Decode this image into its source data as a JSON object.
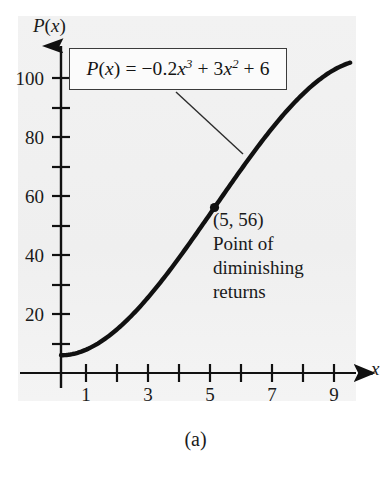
{
  "figure": {
    "caption": "(a)",
    "background_color": "#f1f1f1",
    "ink_color": "#111111"
  },
  "formula": {
    "lhs": "P(x)",
    "eq": "=",
    "text": "P(x) = –0.2x³ + 3x² + 6",
    "coef_cubic": "–0.2",
    "exp_cubic": "3",
    "coef_quadratic": "3",
    "exp_quadratic": "2",
    "constant": "6",
    "boxed": true
  },
  "annotations": {
    "point_label": "(5, 56)",
    "line2": "Point of",
    "line3": "diminishing",
    "line4": "returns"
  },
  "axes": {
    "y_axis_label": "P(x)",
    "x_axis_label": "x",
    "y_ticks_labeled": [
      20,
      40,
      60,
      80,
      100
    ],
    "y_ticks_minor": [
      10,
      30,
      50,
      70,
      90
    ],
    "x_ticks_labeled": [
      1,
      3,
      5,
      7,
      9
    ],
    "x_ticks_minor": [
      2,
      4,
      6,
      8,
      10
    ],
    "x_range": [
      -0.45,
      10.3
    ],
    "y_range": [
      -5,
      112
    ]
  },
  "chart_data": {
    "type": "line",
    "title": "",
    "subtitle": "",
    "xlabel": "x",
    "ylabel": "P(x)",
    "xlim": [
      -0.45,
      10.3
    ],
    "ylim": [
      -5,
      112
    ],
    "grid": false,
    "legend": "none",
    "equation": "P(x) = -0.2x^3 + 3x^2 + 6",
    "x_tick_labels": [
      "1",
      "3",
      "5",
      "7",
      "9"
    ],
    "x_tick_values": [
      1,
      3,
      5,
      7,
      9
    ],
    "y_tick_labels": [
      "20",
      "40",
      "60",
      "80",
      "100"
    ],
    "y_tick_values": [
      20,
      40,
      60,
      80,
      100
    ],
    "series": [
      {
        "name": "P(x) = -0.2x^3 + 3x^2 + 6",
        "x": [
          0,
          0.5,
          1,
          1.5,
          2,
          2.5,
          3,
          3.5,
          4,
          4.5,
          5,
          5.5,
          6,
          6.5,
          7,
          7.5,
          8,
          8.5,
          9,
          9.4
        ],
        "y": [
          6,
          6.725,
          8.8,
          12.075,
          16.4,
          22.625,
          28.6,
          37.725,
          46.4,
          55.275,
          56,
          72.975,
          80.4,
          88.075,
          92.4,
          98.625,
          102.4,
          105.275,
          106.2,
          105.0
        ]
      }
    ],
    "annotated_points": [
      {
        "x": 5,
        "y": 56,
        "label": "(5, 56)",
        "description": "Point of diminishing returns",
        "marker": "filled-circle"
      }
    ]
  }
}
